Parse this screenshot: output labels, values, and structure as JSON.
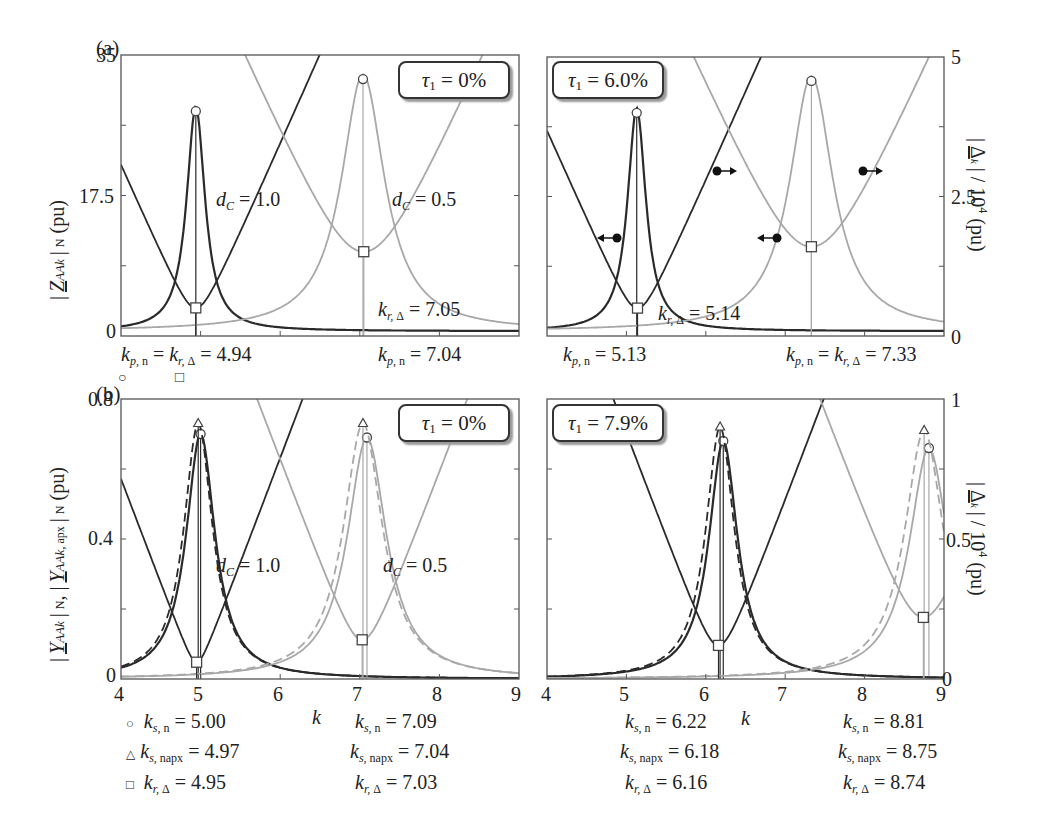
{
  "figure": {
    "panel_a_label": "(a)",
    "panel_b_label": "(b)",
    "x_axis_label": "k",
    "a_left_ylabel": "|Z_AAk|_N (pu)",
    "a_right_ylabel": "|Δ_k| / 10^4 (pu)",
    "b_left_ylabel": "|Y_AAk|_N, |Y_AAk,apx|_N (pu)",
    "b_right_ylabel": "|Δ_k| / 10^4 (pu)",
    "a_left_yticks": [
      "35",
      "17.5",
      "0"
    ],
    "a_right_yticks": [
      "5",
      "2.5",
      "0"
    ],
    "b_left_yticks": [
      "0.8",
      "0.4",
      "0"
    ],
    "b_right_yticks": [
      "1",
      "0.5",
      "0"
    ],
    "xticks": [
      "4",
      "5",
      "6",
      "7",
      "8",
      "9"
    ],
    "a_left_tau": "0%",
    "a_right_tau": "6.0%",
    "b_left_tau": "0%",
    "b_right_tau": "7.9%",
    "a_left_dc1": "= 1.0",
    "a_left_dc2": "= 0.5",
    "b_left_dc1": "= 1.0",
    "b_left_dc2": "= 0.5",
    "a_left_kr": "= 7.05",
    "a_left_kp1": "= 4.94",
    "a_left_kp2": "= 7.04",
    "a_right_kr": "= 5.14",
    "a_right_kp1": "= 5.13",
    "a_right_kp2": "= 7.33",
    "b_left_legend": {
      "ks_n_1": "= 5.00",
      "ks_napx_1": "= 4.97",
      "kr_1": "= 4.95",
      "ks_n_2": "= 7.09",
      "ks_napx_2": "= 7.04",
      "kr_2": "= 7.03"
    },
    "b_right_legend": {
      "ks_n_1": "= 6.22",
      "ks_napx_1": "= 6.18",
      "kr_1": "= 6.16",
      "ks_n_2": "= 8.81",
      "ks_napx_2": "= 8.75",
      "kr_2": "= 8.74"
    },
    "colors": {
      "dark": "#2a2a2a",
      "light": "#a8a8a8",
      "frame": "#555555"
    }
  },
  "chart_data": [
    {
      "type": "line",
      "title": "(a) left, tau1 = 0%",
      "xlabel": "k",
      "ylabel": "|Z_AAk|_N (pu)",
      "y2label": "|Δ_k| / 10^4 (pu)",
      "xlim": [
        4,
        9
      ],
      "ylim": [
        0,
        35
      ],
      "y2lim": [
        0,
        5
      ],
      "series": [
        {
          "name": "|Z_AAk| dC=1.0",
          "peak_k": 4.94,
          "peak_value": 28.0,
          "color": "dark"
        },
        {
          "name": "|Z_AAk| dC=0.5",
          "peak_k": 7.04,
          "peak_value": 32.0,
          "color": "light"
        },
        {
          "name": "|Δ_k| dC=1.0",
          "min_k": 4.94,
          "min_value_y2": 0.5,
          "color": "dark"
        },
        {
          "name": "|Δ_k| dC=0.5",
          "min_k": 7.05,
          "min_value_y2": 1.5,
          "color": "light"
        }
      ],
      "annotations": [
        "dC = 1.0",
        "dC = 0.5",
        "k_r,Δ = 7.05",
        "k_p,n = k_r,Δ = 4.94",
        "k_p,n = 7.04"
      ]
    },
    {
      "type": "line",
      "title": "(a) right, tau1 = 6.0%",
      "xlim": [
        4,
        9
      ],
      "ylim": [
        0,
        35
      ],
      "y2lim": [
        0,
        5
      ],
      "series": [
        {
          "name": "|Z_AAk| dC=1.0",
          "peak_k": 5.13,
          "peak_value": 28.0,
          "color": "dark"
        },
        {
          "name": "|Z_AAk| dC=0.5",
          "peak_k": 7.33,
          "peak_value": 32.0,
          "color": "light"
        },
        {
          "name": "|Δ_k| dC=1.0",
          "min_k": 5.14,
          "min_value_y2": 0.5,
          "color": "dark"
        },
        {
          "name": "|Δ_k| dC=0.5",
          "min_k": 7.33,
          "min_value_y2": 1.6,
          "color": "light"
        }
      ],
      "annotations": [
        "k_r,Δ = 5.14",
        "k_p,n = 5.13",
        "k_p,n = k_r,Δ = 7.33"
      ]
    },
    {
      "type": "line",
      "title": "(b) left, tau1 = 0%",
      "xlim": [
        4,
        9
      ],
      "ylim": [
        0,
        0.8
      ],
      "y2lim": [
        0,
        1
      ],
      "series": [
        {
          "name": "|Y_AAk| dC=1.0",
          "peak_k": 5.0,
          "peak_value": 0.7,
          "color": "dark"
        },
        {
          "name": "|Y_AAk,apx| dC=1.0",
          "peak_k": 4.97,
          "peak_value": 0.73,
          "color": "dark",
          "dashed": true
        },
        {
          "name": "|Y_AAk| dC=0.5",
          "peak_k": 7.09,
          "peak_value": 0.69,
          "color": "light"
        },
        {
          "name": "|Y_AAk,apx| dC=0.5",
          "peak_k": 7.04,
          "peak_value": 0.73,
          "color": "light",
          "dashed": true
        },
        {
          "name": "|Δ_k| dC=1.0",
          "min_k": 4.95,
          "min_value_y2": 0.06,
          "color": "dark"
        },
        {
          "name": "|Δ_k| dC=0.5",
          "min_k": 7.03,
          "min_value_y2": 0.14,
          "color": "light"
        }
      ],
      "annotations": [
        "dC = 1.0",
        "dC = 0.5",
        "k_s,n = 5.00",
        "k_s,napx = 4.97",
        "k_r,Δ = 4.95",
        "k_s,n = 7.09",
        "k_s,napx = 7.04",
        "k_r,Δ = 7.03"
      ]
    },
    {
      "type": "line",
      "title": "(b) right, tau1 = 7.9%",
      "xlim": [
        4,
        9
      ],
      "ylim": [
        0,
        0.8
      ],
      "y2lim": [
        0,
        1
      ],
      "series": [
        {
          "name": "|Y_AAk| dC=1.0",
          "peak_k": 6.22,
          "peak_value": 0.68,
          "color": "dark"
        },
        {
          "name": "|Y_AAk,apx| dC=1.0",
          "peak_k": 6.18,
          "peak_value": 0.72,
          "color": "dark",
          "dashed": true
        },
        {
          "name": "|Y_AAk| dC=0.5",
          "peak_k": 8.81,
          "peak_value": 0.66,
          "color": "light"
        },
        {
          "name": "|Y_AAk,apx| dC=0.5",
          "peak_k": 8.75,
          "peak_value": 0.71,
          "color": "light",
          "dashed": true
        },
        {
          "name": "|Δ_k| dC=1.0",
          "min_k": 6.16,
          "min_value_y2": 0.12,
          "color": "dark"
        },
        {
          "name": "|Δ_k| dC=0.5",
          "min_k": 8.74,
          "min_value_y2": 0.22,
          "color": "light"
        }
      ],
      "annotations": [
        "k_s,n = 6.22",
        "k_s,napx = 6.18",
        "k_r,Δ = 6.16",
        "k_s,n = 8.81",
        "k_s,napx = 8.75",
        "k_r,Δ = 8.74"
      ]
    }
  ]
}
